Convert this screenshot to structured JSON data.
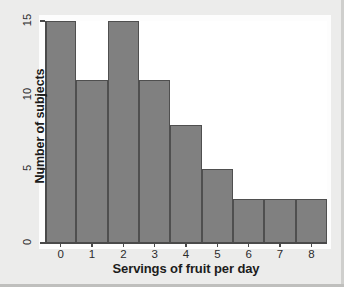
{
  "figure": {
    "background_color": "#ececeb",
    "plot_background_color": "#ffffff",
    "bar_fill_color": "#808080",
    "bar_edge_color": "#4f4f4f",
    "axis_color": "#4a4a4a"
  },
  "chart_data": {
    "type": "bar",
    "title": "",
    "subtitle": "",
    "xlabel": "Servings of fruit per day",
    "ylabel": "Number of subjects",
    "categories": [
      "0",
      "1",
      "2",
      "3",
      "4",
      "5",
      "6",
      "7",
      "8"
    ],
    "values": [
      15,
      11,
      15,
      11,
      8,
      5,
      3,
      3,
      3
    ],
    "x_tick_labels": [
      "0",
      "1",
      "2",
      "3",
      "4",
      "5",
      "6",
      "7",
      "8"
    ],
    "y_tick_labels": [
      "0",
      "5",
      "10",
      "15"
    ],
    "y_ticks": [
      0,
      5,
      10,
      15
    ],
    "ylim": [
      0,
      15
    ],
    "xlim": [
      -0.5,
      8.5
    ],
    "grid": false,
    "legend": false,
    "legend_position": "none",
    "bar_width": 1.0,
    "annotations": []
  }
}
